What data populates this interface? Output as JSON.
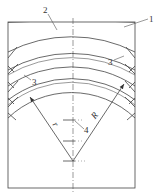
{
  "diagram": {
    "type": "engineering-drawing",
    "labels": {
      "frame": "1",
      "outer_band": "2",
      "shim_right": "3",
      "shim_left": "3",
      "center_marks": "4",
      "radius_large": "R",
      "radius_small": "r"
    },
    "colors": {
      "line": "#444444",
      "text": "#333333",
      "background": "#ffffff"
    }
  }
}
